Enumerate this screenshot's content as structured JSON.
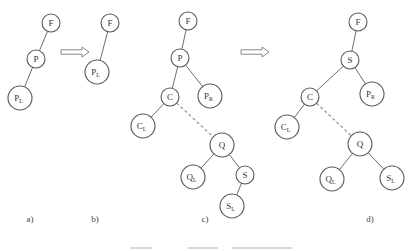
{
  "figure": {
    "panels": [
      {
        "id": "a",
        "label": "a)",
        "label_pos": [
          30,
          222
        ],
        "nodes": [
          {
            "id": "F",
            "base": "F",
            "sub": "",
            "x": 51,
            "y": 23,
            "r": 9
          },
          {
            "id": "P",
            "base": "P",
            "sub": "",
            "x": 36,
            "y": 59,
            "r": 9
          },
          {
            "id": "PL",
            "base": "P",
            "sub": "L",
            "x": 20,
            "y": 98,
            "r": 12
          }
        ],
        "edges": [
          {
            "from": "F",
            "to": "P",
            "style": "solid"
          },
          {
            "from": "P",
            "to": "PL",
            "style": "solid"
          }
        ]
      },
      {
        "id": "b",
        "label": "b)",
        "label_pos": [
          95,
          222
        ],
        "nodes": [
          {
            "id": "F",
            "base": "F",
            "sub": "",
            "x": 110,
            "y": 23,
            "r": 9
          },
          {
            "id": "PL",
            "base": "P",
            "sub": "L",
            "x": 97,
            "y": 72,
            "r": 12
          }
        ],
        "edges": [
          {
            "from": "F",
            "to": "PL",
            "style": "solid"
          }
        ]
      },
      {
        "id": "c",
        "label": "c)",
        "label_pos": [
          205,
          222
        ],
        "nodes": [
          {
            "id": "F",
            "base": "F",
            "sub": "",
            "x": 188,
            "y": 21,
            "r": 9
          },
          {
            "id": "P",
            "base": "P",
            "sub": "",
            "x": 180,
            "y": 58,
            "r": 9
          },
          {
            "id": "C",
            "base": "C",
            "sub": "",
            "x": 170,
            "y": 97,
            "r": 9
          },
          {
            "id": "PR",
            "base": "P",
            "sub": "R",
            "x": 210,
            "y": 96,
            "r": 12
          },
          {
            "id": "CL",
            "base": "C",
            "sub": "L",
            "x": 143,
            "y": 126,
            "r": 12
          },
          {
            "id": "Q",
            "base": "Q",
            "sub": "",
            "x": 222,
            "y": 145,
            "r": 12
          },
          {
            "id": "QL",
            "base": "Q",
            "sub": "L",
            "x": 193,
            "y": 177,
            "r": 12
          },
          {
            "id": "S",
            "base": "S",
            "sub": "",
            "x": 245,
            "y": 175,
            "r": 9
          },
          {
            "id": "SL",
            "base": "S",
            "sub": "L",
            "x": 232,
            "y": 206,
            "r": 12
          }
        ],
        "edges": [
          {
            "from": "F",
            "to": "P",
            "style": "solid"
          },
          {
            "from": "P",
            "to": "C",
            "style": "solid"
          },
          {
            "from": "P",
            "to": "PR",
            "style": "solid"
          },
          {
            "from": "C",
            "to": "CL",
            "style": "solid"
          },
          {
            "from": "C",
            "to": "Q",
            "style": "dashed"
          },
          {
            "from": "Q",
            "to": "QL",
            "style": "solid"
          },
          {
            "from": "Q",
            "to": "S",
            "style": "solid"
          },
          {
            "from": "S",
            "to": "SL",
            "style": "solid"
          }
        ]
      },
      {
        "id": "d",
        "label": "d)",
        "label_pos": [
          370,
          222
        ],
        "nodes": [
          {
            "id": "F",
            "base": "F",
            "sub": "",
            "x": 358,
            "y": 22,
            "r": 9
          },
          {
            "id": "S",
            "base": "S",
            "sub": "",
            "x": 350,
            "y": 60,
            "r": 9
          },
          {
            "id": "C",
            "base": "C",
            "sub": "",
            "x": 310,
            "y": 97,
            "r": 9
          },
          {
            "id": "PR",
            "base": "P",
            "sub": "R",
            "x": 372,
            "y": 94,
            "r": 12
          },
          {
            "id": "CL",
            "base": "C",
            "sub": "L",
            "x": 287,
            "y": 127,
            "r": 12
          },
          {
            "id": "Q",
            "base": "Q",
            "sub": "",
            "x": 360,
            "y": 144,
            "r": 12
          },
          {
            "id": "QL",
            "base": "Q",
            "sub": "L",
            "x": 332,
            "y": 179,
            "r": 12
          },
          {
            "id": "SL",
            "base": "S",
            "sub": "L",
            "x": 392,
            "y": 178,
            "r": 12
          }
        ],
        "edges": [
          {
            "from": "F",
            "to": "S",
            "style": "solid"
          },
          {
            "from": "S",
            "to": "C",
            "style": "solid"
          },
          {
            "from": "S",
            "to": "PR",
            "style": "solid"
          },
          {
            "from": "C",
            "to": "CL",
            "style": "solid"
          },
          {
            "from": "C",
            "to": "Q",
            "style": "dashed"
          },
          {
            "from": "Q",
            "to": "QL",
            "style": "solid"
          },
          {
            "from": "Q",
            "to": "SL",
            "style": "solid"
          }
        ]
      }
    ],
    "arrows": [
      {
        "id": "a-to-b",
        "x": 61,
        "y": 52,
        "length": 28
      },
      {
        "id": "c-to-d",
        "x": 241,
        "y": 52,
        "length": 28
      }
    ],
    "caption": {
      "text": "",
      "note": "caption row is cut off / illegible",
      "bars": [
        {
          "x": 130,
          "y": 247,
          "w": 22
        },
        {
          "x": 188,
          "y": 247,
          "w": 30
        },
        {
          "x": 232,
          "y": 247,
          "w": 60
        }
      ]
    },
    "colors": {
      "node_stroke": "#5a5a5a",
      "edge": "#6e6e6e",
      "dashed_edge": "#9a9a9a",
      "text": "#333333",
      "background": "#ffffff"
    }
  }
}
